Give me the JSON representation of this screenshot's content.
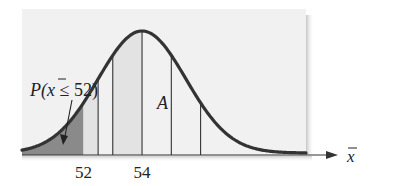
{
  "chart_data": {
    "type": "area",
    "title": "",
    "distribution": "normal",
    "mean": 54,
    "std_dev": 1.5,
    "xlabel": "x̄",
    "ylabel": "",
    "x_tick_labels": [
      {
        "value": 52,
        "label": "52"
      },
      {
        "value": 54,
        "label": "54"
      }
    ],
    "xlim": [
      49.9,
      59.6
    ],
    "vertical_lines_at": [
      52.5,
      53.0,
      54.0,
      55.0,
      56.0
    ],
    "shaded_regions": [
      {
        "name": "tail-probability",
        "from": 49.9,
        "to": 52,
        "shade": "dark"
      },
      {
        "name": "region-light-left",
        "from": 52,
        "to": 52.5,
        "shade": "light"
      },
      {
        "name": "region-A",
        "from": 53.0,
        "to": 54.0,
        "shade": "light"
      }
    ],
    "annotations": [
      {
        "text": "P(x̄ ≤ 52)",
        "points_to": 51.9,
        "kind": "arrow-label"
      },
      {
        "text": "A",
        "region": "region-A",
        "kind": "region-label"
      }
    ],
    "grid": false,
    "legend": "none"
  },
  "colors": {
    "panel": "#f1f1f1",
    "panel_shadow": "#c8c8c8",
    "curve": "#333333",
    "dark_shade": "#8a8a8a",
    "light_shade": "#e3e3e3",
    "axis": "#333333",
    "text": "#222222"
  },
  "labels": {
    "prob_prefix": "P(",
    "prob_var": "x",
    "prob_suffix": " ≤ 52)",
    "region": "A",
    "axis_var": "x"
  }
}
